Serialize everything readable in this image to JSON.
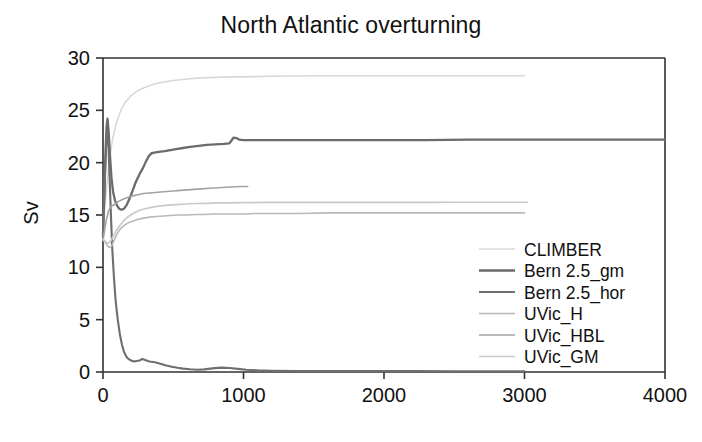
{
  "chart_data": {
    "type": "line",
    "title": "North Atlantic overturning",
    "xlabel": "",
    "ylabel": "Sv",
    "xlim": [
      0,
      4000
    ],
    "ylim": [
      0,
      30
    ],
    "xticks": [
      0,
      1000,
      2000,
      3000,
      4000
    ],
    "yticks": [
      0,
      5,
      10,
      15,
      20,
      25,
      30
    ],
    "grid": false,
    "legend_position": "center-right",
    "series": [
      {
        "name": "CLIMBER",
        "color": "#d8d8d8",
        "linewidth": 1.6,
        "x": [
          0,
          20,
          40,
          60,
          80,
          100,
          130,
          160,
          200,
          250,
          300,
          360,
          430,
          500,
          600,
          700,
          800,
          900,
          1000,
          1200,
          1500,
          1800,
          2100,
          2400,
          2700,
          3000
        ],
        "y": [
          14.0,
          16.8,
          19.5,
          21.6,
          23.0,
          24.0,
          25.1,
          25.8,
          26.4,
          26.9,
          27.2,
          27.5,
          27.7,
          27.85,
          28.0,
          28.1,
          28.15,
          28.2,
          28.2,
          28.25,
          28.3,
          28.3,
          28.3,
          28.3,
          28.3,
          28.3
        ]
      },
      {
        "name": "Bern 2.5_gm",
        "color": "#6b6b6b",
        "linewidth": 2.3,
        "x": [
          0,
          10,
          18,
          25,
          32,
          40,
          50,
          60,
          72,
          85,
          100,
          115,
          130,
          150,
          170,
          190,
          210,
          235,
          260,
          285,
          305,
          325,
          345,
          365,
          385,
          410,
          440,
          480,
          520,
          570,
          620,
          680,
          740,
          800,
          860,
          900,
          930,
          950,
          970,
          1000,
          1100,
          1250,
          1400,
          1600,
          1800,
          2000,
          2300,
          2600,
          2900,
          3200,
          3500,
          3800,
          4000
        ],
        "y": [
          13.0,
          17.5,
          21.0,
          23.4,
          24.2,
          23.0,
          20.6,
          18.6,
          17.2,
          16.4,
          15.9,
          15.6,
          15.5,
          15.6,
          16.0,
          16.6,
          17.3,
          18.2,
          18.9,
          19.5,
          20.1,
          20.6,
          20.9,
          20.95,
          21.0,
          21.05,
          21.1,
          21.2,
          21.3,
          21.4,
          21.5,
          21.6,
          21.7,
          21.75,
          21.8,
          21.85,
          22.4,
          22.35,
          22.2,
          22.15,
          22.15,
          22.15,
          22.15,
          22.15,
          22.15,
          22.15,
          22.15,
          22.2,
          22.2,
          22.2,
          22.2,
          22.2,
          22.2
        ]
      },
      {
        "name": "Bern 2.5_hor",
        "color": "#6e6e6e",
        "linewidth": 2.1,
        "x": [
          0,
          8,
          15,
          22,
          30,
          38,
          46,
          55,
          65,
          78,
          90,
          105,
          120,
          135,
          150,
          165,
          180,
          200,
          220,
          240,
          260,
          280,
          300,
          330,
          360,
          390,
          420,
          450,
          490,
          530,
          570,
          620,
          670,
          720,
          780,
          840,
          900,
          960,
          1020,
          1100,
          1200,
          1400,
          1600,
          1900,
          2200,
          2500,
          2800,
          3000
        ],
        "y": [
          13.2,
          16.0,
          19.0,
          21.5,
          23.0,
          22.0,
          19.0,
          15.5,
          12.0,
          9.0,
          6.8,
          5.0,
          3.6,
          2.6,
          1.9,
          1.5,
          1.25,
          1.1,
          1.0,
          1.05,
          1.1,
          1.25,
          1.15,
          1.0,
          0.95,
          0.85,
          0.75,
          0.62,
          0.5,
          0.4,
          0.32,
          0.26,
          0.22,
          0.25,
          0.35,
          0.42,
          0.38,
          0.3,
          0.22,
          0.16,
          0.12,
          0.1,
          0.09,
          0.08,
          0.08,
          0.07,
          0.07,
          0.07
        ]
      },
      {
        "name": "UVic_H",
        "color": "#b9b9b9",
        "linewidth": 1.6,
        "x": [
          0,
          15,
          30,
          45,
          60,
          80,
          100,
          125,
          150,
          180,
          210,
          250,
          290,
          330,
          380,
          430,
          480,
          540,
          600,
          660,
          720,
          790,
          860,
          930,
          1000,
          1100,
          1250,
          1400,
          1600,
          1800,
          2000,
          2250,
          2500,
          2750,
          3000
        ],
        "y": [
          12.6,
          12.4,
          12.1,
          11.9,
          12.0,
          12.6,
          13.2,
          13.7,
          14.0,
          14.25,
          14.4,
          14.6,
          14.7,
          14.8,
          14.85,
          14.9,
          14.95,
          15.0,
          15.0,
          15.05,
          15.05,
          15.1,
          15.1,
          15.1,
          15.1,
          15.15,
          15.15,
          15.15,
          15.2,
          15.2,
          15.2,
          15.2,
          15.2,
          15.2,
          15.2
        ]
      },
      {
        "name": "UVic_HBL",
        "color": "#a3a3a3",
        "linewidth": 1.6,
        "x": [
          0,
          12,
          25,
          40,
          55,
          70,
          90,
          110,
          135,
          160,
          190,
          220,
          255,
          290,
          330,
          370,
          410,
          450,
          500,
          550,
          600,
          650,
          700,
          760,
          820,
          880,
          940,
          1000,
          1030
        ],
        "y": [
          12.6,
          13.6,
          14.6,
          15.4,
          15.8,
          15.9,
          16.1,
          16.3,
          16.45,
          16.6,
          16.75,
          16.85,
          16.95,
          17.05,
          17.1,
          17.15,
          17.2,
          17.25,
          17.3,
          17.35,
          17.4,
          17.45,
          17.5,
          17.55,
          17.6,
          17.65,
          17.7,
          17.72,
          17.72
        ]
      },
      {
        "name": "UVic_GM",
        "color": "#c9c9c9",
        "linewidth": 1.7,
        "x": [
          0,
          15,
          30,
          50,
          70,
          95,
          120,
          150,
          185,
          220,
          260,
          300,
          350,
          400,
          460,
          520,
          590,
          660,
          740,
          820,
          900,
          1000,
          1150,
          1300,
          1500,
          1750,
          2000,
          2300,
          2600,
          2900,
          3020
        ],
        "y": [
          12.7,
          12.5,
          12.3,
          12.4,
          12.9,
          13.5,
          14.0,
          14.5,
          14.9,
          15.2,
          15.45,
          15.6,
          15.75,
          15.85,
          15.95,
          16.0,
          16.05,
          16.1,
          16.12,
          16.15,
          16.15,
          16.18,
          16.2,
          16.2,
          16.2,
          16.2,
          16.2,
          16.2,
          16.22,
          16.22,
          16.22
        ]
      }
    ]
  },
  "legend": {
    "items": [
      {
        "label": "CLIMBER"
      },
      {
        "label": "Bern 2.5_gm"
      },
      {
        "label": "Bern 2.5_hor"
      },
      {
        "label": "UVic_H"
      },
      {
        "label": "UVic_HBL"
      },
      {
        "label": "UVic_GM"
      }
    ]
  }
}
